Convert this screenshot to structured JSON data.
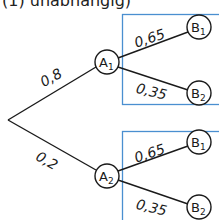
{
  "caption": "(1) unabhängig)",
  "colors": {
    "box_border": "#4a8fd0",
    "line": "#1a1a1a"
  },
  "tree": {
    "root": {
      "x": 8,
      "y": 120
    },
    "first_level": [
      {
        "node": "A",
        "sub": "1",
        "prob": "0,8"
      },
      {
        "node": "A",
        "sub": "2",
        "prob": "0,2"
      }
    ],
    "second_level": [
      {
        "parent": "A1",
        "node": "B",
        "sub": "1",
        "prob": "0,65"
      },
      {
        "parent": "A1",
        "node": "B",
        "sub": "2",
        "prob": "0,35"
      },
      {
        "parent": "A2",
        "node": "B",
        "sub": "1",
        "prob": "0,65"
      },
      {
        "parent": "A2",
        "node": "B",
        "sub": "2",
        "prob": "0,35"
      }
    ]
  }
}
